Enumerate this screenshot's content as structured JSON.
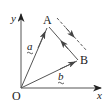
{
  "diagram": {
    "type": "vector-diagram",
    "labels": {
      "origin": "O",
      "x_axis": "x",
      "y_axis": "y",
      "point_a": "A",
      "point_b": "B",
      "vector_a": "a",
      "vector_b": "b"
    },
    "points": {
      "O": [
        21,
        88
      ],
      "A": [
        48,
        26
      ],
      "B": [
        78,
        60
      ]
    },
    "vectors": [
      {
        "name": "vector-a",
        "from": "O",
        "to": "A",
        "label": "a"
      },
      {
        "name": "vector-b",
        "from": "O",
        "to": "B",
        "label": "b"
      },
      {
        "name": "vector-ba",
        "from": "B",
        "to": "A",
        "label": ""
      }
    ],
    "dashed_line": {
      "from": [
        57,
        18
      ],
      "to": [
        87,
        50
      ],
      "arrow_direction": "down-right"
    },
    "colors": {
      "line": "#555555",
      "text": "#222222",
      "background": "#ffffff"
    }
  }
}
